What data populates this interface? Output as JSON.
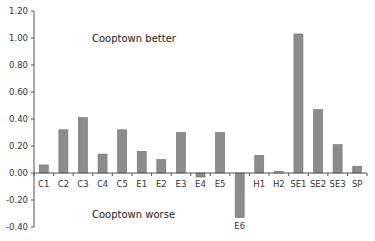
{
  "chart_data": {
    "type": "bar",
    "title": "",
    "xlabel": "",
    "ylabel": "",
    "categories": [
      "C1",
      "C2",
      "C3",
      "C4",
      "C5",
      "E1",
      "E2",
      "E3",
      "E4",
      "E5",
      "E6",
      "H1",
      "H2",
      "SE1",
      "SE2",
      "SE3",
      "SP"
    ],
    "values": [
      0.06,
      0.32,
      0.41,
      0.14,
      0.32,
      0.16,
      0.1,
      0.3,
      -0.03,
      0.3,
      -0.33,
      0.13,
      0.01,
      1.03,
      0.47,
      0.21,
      0.05
    ],
    "ylim": [
      -0.4,
      1.2
    ],
    "yticks": [
      "1.20",
      "1.00",
      "0.80",
      "0.60",
      "0.40",
      "0.20",
      "0.00",
      "-0.20",
      "-0.40"
    ],
    "ytick_values": [
      1.2,
      1.0,
      0.8,
      0.6,
      0.4,
      0.2,
      0.0,
      -0.2,
      -0.4
    ],
    "annotations": {
      "top": "Cooptown better",
      "bottom": "Cooptown worse"
    },
    "grid": false,
    "legend": "none",
    "bar_color": "#8c8c8c"
  }
}
